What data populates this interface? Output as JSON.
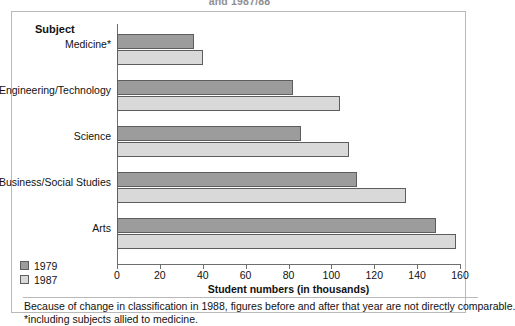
{
  "title_fragment": "and 1987/88",
  "axis_heading": "Subject",
  "legend": {
    "items": [
      {
        "label": "1979",
        "color": "#9c9c9c",
        "name": "legend-1979"
      },
      {
        "label": "1987",
        "color": "#d9d9d9",
        "name": "legend-1987"
      }
    ]
  },
  "footnotes": [
    "Because of change in classification in 1988, figures before and after that year are not directly comparable.",
    "*including subjects allied to medicine."
  ],
  "chart_data": {
    "type": "bar",
    "orientation": "horizontal",
    "title": "and 1987/88",
    "xlabel": "Student numbers (in thousands)",
    "ylabel": "Subject",
    "categories": [
      "Medicine*",
      "Engineering/Technology",
      "Science",
      "Business/Social Studies",
      "Arts"
    ],
    "series": [
      {
        "name": "1979",
        "color": "#9c9c9c",
        "values": [
          36,
          82,
          86,
          112,
          149
        ]
      },
      {
        "name": "1987",
        "color": "#d9d9d9",
        "values": [
          40,
          104,
          108,
          135,
          158
        ]
      }
    ],
    "xlim": [
      0,
      160
    ],
    "xticks": [
      0,
      20,
      40,
      60,
      80,
      100,
      120,
      140,
      160
    ],
    "xtick_labels": [
      "0",
      "20",
      "40",
      "60",
      "80",
      "100",
      "120",
      "140",
      "160"
    ],
    "grid": false,
    "legend_position": "bottom-left",
    "notes": [
      "Because of change in classification in 1988, figures before and after that year are not directly comparable.",
      "*including subjects allied to medicine."
    ]
  }
}
